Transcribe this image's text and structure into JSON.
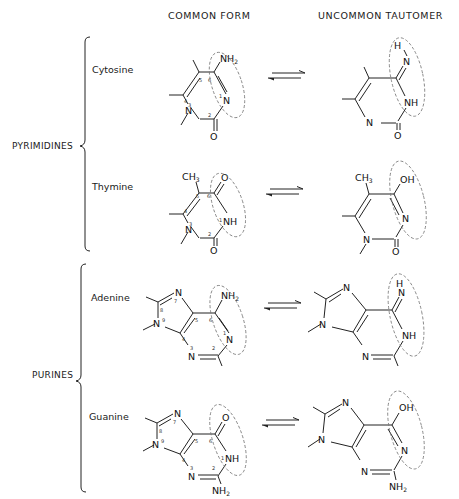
{
  "headers": {
    "common": "COMMON FORM",
    "uncommon": "UNCOMMON TAUTOMER"
  },
  "groups": [
    {
      "label": "PYRIMIDINES",
      "bases": [
        "Cytosine",
        "Thymine"
      ]
    },
    {
      "label": "PURINES",
      "bases": [
        "Adenine",
        "Guanine"
      ]
    }
  ],
  "bases": {
    "cytosine": {
      "name": "Cytosine",
      "common_groups": [
        "NH2",
        "N"
      ],
      "tautomer_groups": [
        "H",
        "N",
        "NH"
      ],
      "ring_numbers": [
        "1",
        "2",
        "3",
        "4",
        "5",
        "6"
      ]
    },
    "thymine": {
      "name": "Thymine",
      "common_groups": [
        "CH3",
        "O",
        "NH",
        "O"
      ],
      "tautomer_groups": [
        "CH3",
        "OH",
        "N",
        "O"
      ],
      "ring_numbers": [
        "1",
        "2",
        "3",
        "4",
        "5",
        "6"
      ]
    },
    "adenine": {
      "name": "Adenine",
      "common_groups": [
        "NH2",
        "N"
      ],
      "tautomer_groups": [
        "H",
        "N",
        "NH"
      ],
      "ring_numbers": [
        "1",
        "2",
        "3",
        "4",
        "5",
        "6",
        "7",
        "8",
        "9"
      ]
    },
    "guanine": {
      "name": "Guanine",
      "common_groups": [
        "O",
        "NH",
        "NH2"
      ],
      "tautomer_groups": [
        "OH",
        "N",
        "NH2"
      ],
      "ring_numbers": [
        "1",
        "2",
        "3",
        "4",
        "5",
        "6",
        "7",
        "8",
        "9"
      ]
    }
  },
  "equilibrium_arrow": "⇌"
}
